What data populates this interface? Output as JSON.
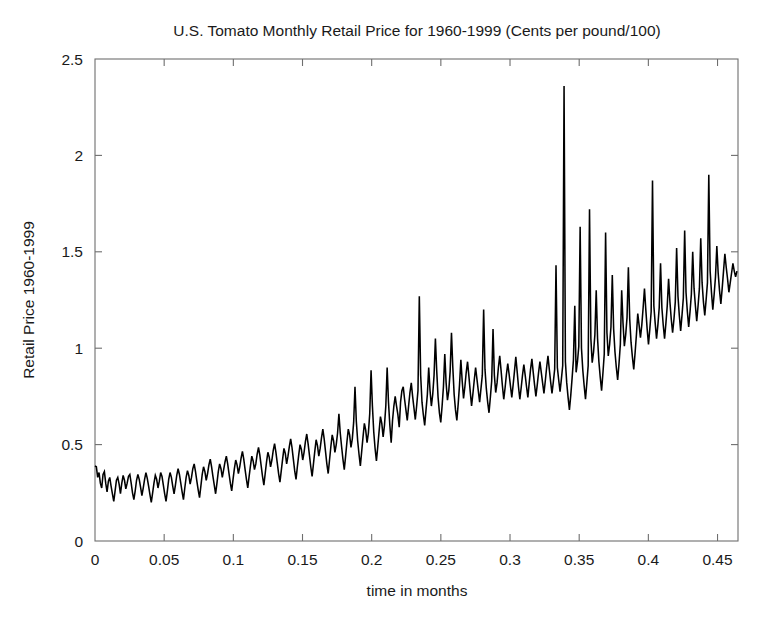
{
  "figure": {
    "width": 776,
    "height": 626,
    "background": "#ffffff",
    "line_color": "#000000",
    "axis_color": "#6e6e6e",
    "text_color": "#1a1a1a"
  },
  "chart_data": {
    "type": "line",
    "title": "U.S. Tomato Monthly Retail Price for 1960-1999 (Cents per pound/100)",
    "xlabel": "time in months",
    "ylabel": "Retail Price 1960-1999",
    "xlim": [
      0,
      0.4648
    ],
    "ylim": [
      0,
      2.5
    ],
    "xticks": [
      0,
      0.05,
      0.1,
      0.15,
      0.2,
      0.25,
      0.3,
      0.35,
      0.4,
      0.45
    ],
    "xtick_labels": [
      "0",
      "0.05",
      "0.1",
      "0.15",
      "0.2",
      "0.25",
      "0.3",
      "0.35",
      "0.4",
      "0.45"
    ],
    "yticks": [
      0,
      0.5,
      1,
      1.5,
      2,
      2.5
    ],
    "ytick_labels": [
      "0",
      "0.5",
      "1",
      "1.5",
      "2",
      "2.5"
    ],
    "grid": false,
    "legend": null,
    "series_name": "U.S. Tomato Monthly Retail Price",
    "n_points": 480,
    "x_step": 0.00096875,
    "max_value": 2.36,
    "max_value_x": 0.3315,
    "min_value": 0.195,
    "start_value": 0.39,
    "end_value": 1.4,
    "values": [
      0.39,
      0.385,
      0.33,
      0.355,
      0.3,
      0.275,
      0.345,
      0.36,
      0.3,
      0.255,
      0.31,
      0.33,
      0.285,
      0.245,
      0.205,
      0.26,
      0.315,
      0.33,
      0.295,
      0.245,
      0.3,
      0.34,
      0.315,
      0.27,
      0.3,
      0.335,
      0.345,
      0.3,
      0.25,
      0.215,
      0.26,
      0.315,
      0.345,
      0.32,
      0.28,
      0.235,
      0.275,
      0.32,
      0.355,
      0.325,
      0.285,
      0.24,
      0.2,
      0.25,
      0.3,
      0.34,
      0.32,
      0.275,
      0.31,
      0.355,
      0.335,
      0.29,
      0.245,
      0.205,
      0.26,
      0.32,
      0.355,
      0.33,
      0.285,
      0.245,
      0.29,
      0.34,
      0.375,
      0.345,
      0.3,
      0.255,
      0.215,
      0.275,
      0.33,
      0.365,
      0.34,
      0.295,
      0.33,
      0.375,
      0.4,
      0.36,
      0.31,
      0.265,
      0.225,
      0.285,
      0.345,
      0.385,
      0.36,
      0.315,
      0.35,
      0.395,
      0.425,
      0.385,
      0.335,
      0.29,
      0.245,
      0.3,
      0.36,
      0.4,
      0.375,
      0.33,
      0.37,
      0.41,
      0.44,
      0.4,
      0.35,
      0.3,
      0.26,
      0.32,
      0.375,
      0.42,
      0.395,
      0.35,
      0.385,
      0.43,
      0.465,
      0.425,
      0.37,
      0.32,
      0.275,
      0.335,
      0.39,
      0.44,
      0.415,
      0.37,
      0.4,
      0.45,
      0.485,
      0.445,
      0.39,
      0.335,
      0.29,
      0.35,
      0.41,
      0.46,
      0.435,
      0.385,
      0.42,
      0.47,
      0.505,
      0.46,
      0.405,
      0.35,
      0.305,
      0.365,
      0.425,
      0.48,
      0.455,
      0.4,
      0.44,
      0.49,
      0.53,
      0.485,
      0.425,
      0.365,
      0.32,
      0.385,
      0.445,
      0.5,
      0.475,
      0.42,
      0.46,
      0.515,
      0.555,
      0.505,
      0.445,
      0.385,
      0.335,
      0.4,
      0.465,
      0.525,
      0.495,
      0.44,
      0.48,
      0.535,
      0.58,
      0.53,
      0.465,
      0.4,
      0.35,
      0.42,
      0.49,
      0.55,
      0.52,
      0.46,
      0.5,
      0.56,
      0.66,
      0.56,
      0.49,
      0.425,
      0.37,
      0.44,
      0.515,
      0.58,
      0.55,
      0.485,
      0.53,
      0.615,
      0.8,
      0.62,
      0.52,
      0.45,
      0.39,
      0.465,
      0.54,
      0.61,
      0.575,
      0.51,
      0.56,
      0.66,
      0.885,
      0.7,
      0.565,
      0.48,
      0.415,
      0.49,
      0.57,
      0.645,
      0.61,
      0.54,
      0.6,
      0.7,
      0.9,
      0.72,
      0.6,
      0.51,
      0.625,
      0.7,
      0.75,
      0.7,
      0.655,
      0.59,
      0.72,
      0.78,
      0.8,
      0.735,
      0.68,
      0.625,
      0.7,
      0.77,
      0.82,
      0.75,
      0.69,
      0.63,
      0.7,
      0.78,
      1.27,
      0.86,
      0.72,
      0.655,
      0.6,
      0.68,
      0.76,
      0.9,
      0.78,
      0.7,
      0.76,
      0.86,
      1.05,
      0.88,
      0.745,
      0.665,
      0.615,
      0.7,
      0.8,
      0.97,
      0.82,
      0.73,
      0.78,
      0.88,
      1.08,
      0.9,
      0.76,
      0.68,
      0.625,
      0.71,
      0.81,
      0.94,
      0.83,
      0.74,
      0.8,
      0.875,
      0.93,
      0.855,
      0.775,
      0.7,
      0.765,
      0.835,
      0.9,
      0.84,
      0.78,
      0.72,
      0.79,
      0.86,
      1.2,
      0.89,
      0.79,
      0.72,
      0.665,
      0.745,
      0.83,
      1.1,
      0.86,
      0.77,
      0.82,
      0.9,
      0.96,
      0.885,
      0.805,
      0.735,
      0.795,
      0.865,
      0.92,
      0.865,
      0.805,
      0.745,
      0.81,
      0.88,
      0.955,
      0.88,
      0.8,
      0.735,
      0.795,
      0.86,
      0.915,
      0.86,
      0.8,
      0.745,
      0.82,
      0.89,
      0.945,
      0.875,
      0.81,
      0.75,
      0.81,
      0.875,
      0.93,
      0.875,
      0.82,
      0.765,
      0.83,
      0.9,
      0.96,
      0.89,
      0.825,
      0.765,
      0.825,
      0.89,
      1.43,
      0.9,
      0.835,
      0.775,
      0.84,
      0.91,
      2.36,
      0.93,
      0.82,
      0.745,
      0.68,
      0.755,
      0.845,
      0.94,
      1.22,
      0.875,
      0.93,
      1.01,
      1.63,
      1.0,
      0.885,
      0.805,
      0.735,
      0.82,
      0.91,
      1.72,
      1.05,
      0.925,
      0.98,
      1.07,
      1.3,
      1.05,
      0.93,
      0.85,
      0.78,
      0.87,
      0.97,
      1.6,
      1.08,
      0.96,
      1.02,
      1.11,
      1.38,
      1.1,
      0.98,
      0.9,
      0.835,
      0.92,
      1.02,
      1.3,
      1.13,
      1.01,
      1.07,
      1.16,
      1.42,
      1.15,
      1.03,
      0.955,
      0.89,
      0.975,
      1.07,
      1.18,
      1.12,
      1.055,
      1.12,
      1.21,
      1.31,
      1.2,
      1.1,
      1.02,
      1.1,
      1.19,
      1.87,
      1.22,
      1.13,
      1.05,
      1.12,
      1.21,
      1.44,
      1.21,
      1.12,
      1.05,
      1.13,
      1.22,
      1.36,
      1.24,
      1.15,
      1.08,
      1.15,
      1.24,
      1.52,
      1.27,
      1.17,
      1.09,
      1.17,
      1.26,
      1.61,
      1.29,
      1.19,
      1.11,
      1.19,
      1.28,
      1.5,
      1.31,
      1.22,
      1.14,
      1.22,
      1.31,
      1.57,
      1.34,
      1.24,
      1.17,
      1.25,
      1.34,
      1.9,
      1.4,
      1.29,
      1.2,
      1.28,
      1.37,
      1.53,
      1.39,
      1.3,
      1.23,
      1.31,
      1.4,
      1.49,
      1.42,
      1.36,
      1.29,
      1.34,
      1.39,
      1.44,
      1.4,
      1.37,
      1.4
    ]
  }
}
